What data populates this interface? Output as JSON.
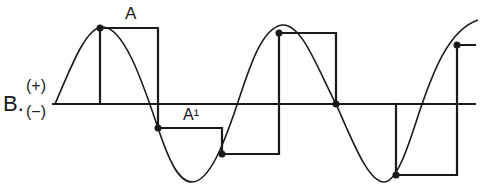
{
  "diagram": {
    "type": "sample-and-hold waveform",
    "labels": {
      "a": "A",
      "a_prime": "A¹",
      "b": "B.",
      "positive": "(+)",
      "negative": "(−)"
    },
    "colors": {
      "stroke": "#1a1a1a",
      "background": "#ffffff"
    },
    "axis": {
      "y": 104,
      "x_start": 52,
      "x_end": 476
    },
    "sample_points": [
      {
        "x": 100,
        "y": 28
      },
      {
        "x": 158,
        "y": 128
      },
      {
        "x": 222,
        "y": 154
      },
      {
        "x": 279,
        "y": 33
      },
      {
        "x": 336,
        "y": 104
      },
      {
        "x": 396,
        "y": 175
      },
      {
        "x": 457,
        "y": 45
      }
    ]
  }
}
